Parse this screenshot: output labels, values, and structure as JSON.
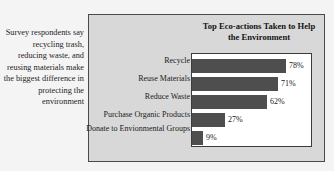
{
  "caption": {
    "text": "Survey respondents say recycling trash, reducing waste, and reusing materials make the biggest difference in protecting the environment"
  },
  "chart_data": {
    "type": "bar",
    "orientation": "horizontal",
    "title": "Top Eco-actions Taken to Help the Environment",
    "xlabel": "",
    "ylabel": "",
    "xlim": [
      0,
      100
    ],
    "grid": false,
    "legend": false,
    "categories": [
      "Recycle",
      "Reuse Materials",
      "Reduce Waste",
      "Purchase Organic Products",
      "Donate to Envionmental Groups"
    ],
    "values": [
      78,
      71,
      62,
      27,
      9
    ],
    "value_labels": [
      "78%",
      "71%",
      "62%",
      "27%",
      "9%"
    ],
    "colors": {
      "bar": "#4e4e4e",
      "panel": "#d8d8d8",
      "plot_background": "#ffffff",
      "frame": "#4a4a4a",
      "text": "#1a1a1a"
    }
  }
}
